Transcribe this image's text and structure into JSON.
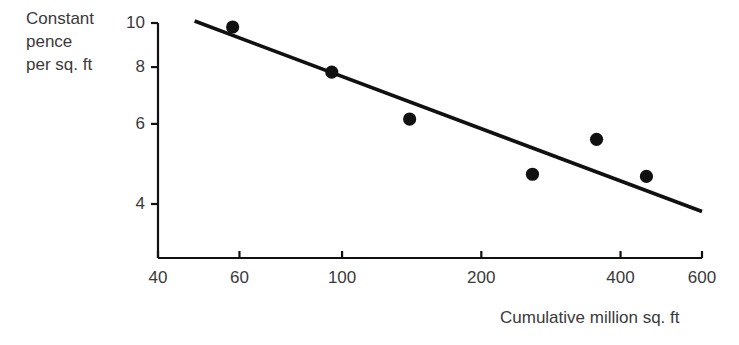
{
  "chart_data": {
    "type": "scatter",
    "title": "",
    "xlabel": "Cumulative million sq. ft",
    "ylabel": "Constant pence per sq. ft",
    "ylabel_lines": [
      "Constant",
      "pence",
      "per sq. ft"
    ],
    "xscale": "log",
    "yscale": "log",
    "xlim": [
      40,
      600
    ],
    "ylim": [
      3.75,
      10.2
    ],
    "grid": false,
    "legend": false,
    "xticks": [
      40,
      60,
      100,
      200,
      400,
      600
    ],
    "xtick_labels": [
      "40",
      "60",
      "100",
      "200",
      "400",
      "600"
    ],
    "yticks": [
      4,
      6,
      8,
      10
    ],
    "ytick_labels": [
      "4",
      "6",
      "8",
      "10"
    ],
    "series": [
      {
        "name": "observations",
        "marker": "circle",
        "color": "#111111",
        "points": [
          {
            "x": 58,
            "y": 9.8
          },
          {
            "x": 95,
            "y": 7.8
          },
          {
            "x": 140,
            "y": 6.15
          },
          {
            "x": 258,
            "y": 4.65
          },
          {
            "x": 355,
            "y": 5.55
          },
          {
            "x": 455,
            "y": 4.6
          }
        ]
      },
      {
        "name": "trend-line",
        "type": "line",
        "color": "#111111",
        "points": [
          {
            "x": 48,
            "y": 10.1
          },
          {
            "x": 600,
            "y": 3.85
          }
        ]
      }
    ]
  },
  "axes": {
    "x_axis_label": "Cumulative million sq. ft",
    "y_axis_label_line1": "Constant",
    "y_axis_label_line2": "pence",
    "y_axis_label_line3": "per sq. ft"
  },
  "colors": {
    "ink": "#111111",
    "text": "#3a3a3a",
    "background": "#ffffff"
  }
}
